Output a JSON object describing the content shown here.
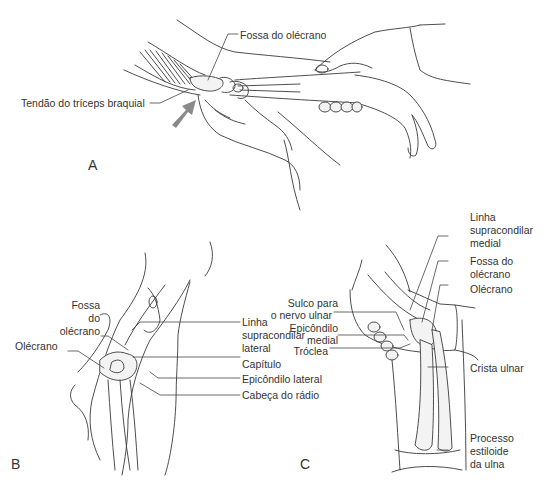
{
  "figure": {
    "panels": {
      "a": {
        "letter": "A",
        "labels": {
          "fossa_olecrano": "Fossa do olécrano",
          "tendao_triceps": "Tendão do tríceps braquial"
        },
        "arrow_color": "#8a8a8a"
      },
      "b": {
        "letter": "B",
        "labels": {
          "fossa_line1": "Fossa",
          "fossa_line2": "do",
          "fossa_line3": "olécrano",
          "olecrano": "Olécrano",
          "linha_line1": "Linha",
          "linha_line2": "supracondilar",
          "linha_line3": "lateral",
          "capitulo": "Capítulo",
          "epicondilo_lateral": "Epicôndilo lateral",
          "cabeca_radio": "Cabeça do rádio"
        }
      },
      "c": {
        "letter": "C",
        "labels": {
          "linha_line1": "Linha",
          "linha_line2": "supracondilar",
          "linha_line3": "medial",
          "fossa_line1": "Fossa do",
          "fossa_line2": "olécrano",
          "olecrano": "Olécrano",
          "sulco_line1": "Sulco para",
          "sulco_line2": "o nervo ulnar",
          "epicondilo_line1": "Epicôndilo",
          "epicondilo_line2": "medial",
          "troclea": "Tróclea",
          "crista_ulnar": "Crista ulnar",
          "processo_line1": "Processo",
          "processo_line2": "estiloide",
          "processo_line3": "da ulna"
        }
      }
    }
  }
}
